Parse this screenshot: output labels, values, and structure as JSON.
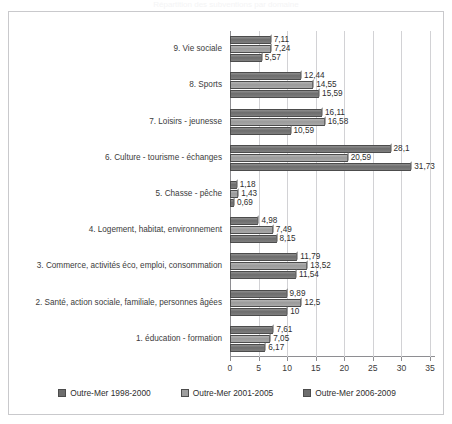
{
  "ghost_title": "Répartition des subventions par domaine",
  "chart_data": {
    "type": "bar",
    "orientation": "horizontal",
    "title": "",
    "xlabel": "",
    "ylabel": "",
    "xlim": [
      0,
      35
    ],
    "xticks": [
      "0",
      "5",
      "10",
      "15",
      "20",
      "25",
      "30",
      "35"
    ],
    "grid": true,
    "legend_position": "bottom",
    "categories": [
      "1. éducation - formation",
      "2. Santé, action sociale, familiale, personnes âgées",
      "3. Commerce, activités éco, emploi, consommation",
      "4. Logement, habitat, environnement",
      "5. Chasse - pêche",
      "6. Culture - tourisme - échanges",
      "7. Loisirs - jeunesse",
      "8. Sports",
      "9. Vie sociale"
    ],
    "series": [
      {
        "name": "Outre-Mer 1998-2000",
        "color": "#6d6d6d",
        "values": [
          7.61,
          9.89,
          11.79,
          4.98,
          1.18,
          28.1,
          16.11,
          12.44,
          7.11
        ],
        "labels": [
          "7,61",
          "9,89",
          "11,79",
          "4,98",
          "1,18",
          "28,1",
          "16,11",
          "12,44",
          "7,11"
        ]
      },
      {
        "name": "Outre-Mer 2001-2005",
        "color": "#9e9e9e",
        "values": [
          7.05,
          12.5,
          13.52,
          7.49,
          1.43,
          20.59,
          16.58,
          14.55,
          7.24
        ],
        "labels": [
          "7,05",
          "12,5",
          "13,52",
          "7,49",
          "1,43",
          "20,59",
          "16,58",
          "14,55",
          "7,24"
        ]
      },
      {
        "name": "Outre-Mer 2006-2009",
        "color": "#6d6d6d",
        "values": [
          6.17,
          10,
          11.54,
          8.15,
          0.69,
          31.73,
          10.59,
          15.59,
          5.57
        ],
        "labels": [
          "6,17",
          "10",
          "11,54",
          "8,15",
          "0,69",
          "31,73",
          "10,59",
          "15,59",
          "5,57"
        ]
      }
    ]
  }
}
